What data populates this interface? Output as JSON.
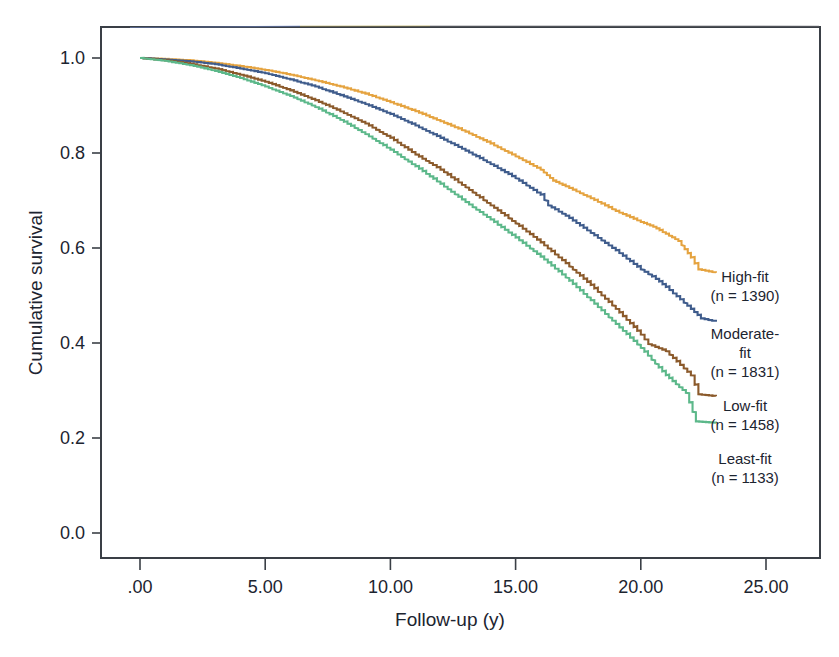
{
  "figure": {
    "background": "#ffffff",
    "frame_color": "#3a3f46"
  },
  "chart_data": {
    "type": "line",
    "subtype": "kaplan-meier-survival",
    "title": "",
    "xlabel": "Follow-up (y)",
    "ylabel": "Cumulative survival",
    "xlim": [
      0,
      26.2
    ],
    "ylim": [
      0,
      1.06
    ],
    "xticks": [
      0,
      5,
      10,
      15,
      20,
      25
    ],
    "xticklabels": [
      ".00",
      "5.00",
      "10.00",
      "15.00",
      "20.00",
      "25.00"
    ],
    "yticks": [
      0.0,
      0.2,
      0.4,
      0.6,
      0.8,
      1.0
    ],
    "yticklabels": [
      "0.0",
      "0.2",
      "0.4",
      "0.6",
      "0.8",
      "1.0"
    ],
    "grid": false,
    "legend_position": "right-inline",
    "series": [
      {
        "name": "High-fit",
        "label_line1": "High-fit",
        "label_line2": "(n = 1390)",
        "n": 1390,
        "color": "#E5A33F",
        "x": [
          0,
          1,
          2,
          3,
          4,
          5,
          6,
          7,
          8,
          9,
          10,
          11,
          12,
          13,
          14,
          15,
          16,
          16.5,
          17,
          18,
          19,
          20,
          20.5,
          21,
          21.5,
          22,
          22.3,
          23
        ],
        "y": [
          1.0,
          0.998,
          0.995,
          0.99,
          0.983,
          0.975,
          0.965,
          0.953,
          0.94,
          0.925,
          0.907,
          0.888,
          0.867,
          0.845,
          0.82,
          0.793,
          0.765,
          0.742,
          0.73,
          0.705,
          0.678,
          0.655,
          0.645,
          0.63,
          0.615,
          0.58,
          0.555,
          0.548
        ]
      },
      {
        "name": "Moderate-fit",
        "label_line1": "Moderate-",
        "label_line2": "fit",
        "label_line3": "(n = 1831)",
        "n": 1831,
        "color": "#3F5C8C",
        "x": [
          0,
          1,
          2,
          3,
          4,
          5,
          6,
          7,
          8,
          9,
          10,
          11,
          12,
          13,
          14,
          15,
          16,
          16.3,
          17,
          18,
          19,
          20,
          20.6,
          21,
          22,
          22.4,
          23
        ],
        "y": [
          1.0,
          0.997,
          0.993,
          0.987,
          0.978,
          0.968,
          0.955,
          0.94,
          0.922,
          0.903,
          0.882,
          0.858,
          0.832,
          0.805,
          0.777,
          0.747,
          0.712,
          0.69,
          0.668,
          0.632,
          0.595,
          0.555,
          0.535,
          0.518,
          0.472,
          0.452,
          0.445
        ]
      },
      {
        "name": "Low-fit",
        "label_line1": "Low-fit",
        "label_line2": "(n = 1458)",
        "n": 1458,
        "color": "#8B5A2B",
        "x": [
          0,
          1,
          2,
          3,
          4,
          5,
          6,
          7,
          8,
          9,
          10,
          11,
          11.7,
          12,
          13,
          14,
          15,
          16,
          17,
          18,
          19,
          20,
          20.3,
          21,
          22,
          22.3,
          23
        ],
        "y": [
          1.0,
          0.995,
          0.988,
          0.978,
          0.965,
          0.95,
          0.932,
          0.911,
          0.888,
          0.862,
          0.832,
          0.797,
          0.775,
          0.765,
          0.728,
          0.69,
          0.652,
          0.612,
          0.568,
          0.522,
          0.472,
          0.418,
          0.398,
          0.383,
          0.332,
          0.292,
          0.288
        ]
      },
      {
        "name": "Least-fit",
        "label_line1": "Least-fit",
        "label_line2": "(n = 1133)",
        "n": 1133,
        "color": "#5CB88A",
        "x": [
          0,
          1,
          2,
          3,
          4,
          5,
          6,
          7,
          8,
          9,
          10,
          11,
          12,
          13,
          14,
          15,
          16,
          17,
          18,
          19,
          20,
          21,
          21.8,
          22.2,
          23
        ],
        "y": [
          1.0,
          0.994,
          0.985,
          0.973,
          0.958,
          0.94,
          0.92,
          0.897,
          0.87,
          0.84,
          0.807,
          0.772,
          0.735,
          0.697,
          0.66,
          0.622,
          0.582,
          0.538,
          0.49,
          0.44,
          0.39,
          0.332,
          0.295,
          0.235,
          0.232
        ]
      }
    ]
  },
  "legend": {
    "entries": [
      {
        "name": "High-fit",
        "lines": [
          "High-fit",
          "(n = 1390)"
        ]
      },
      {
        "name": "Moderate-fit",
        "lines": [
          "Moderate-",
          "fit",
          "(n = 1831)"
        ]
      },
      {
        "name": "Low-fit",
        "lines": [
          "Low-fit",
          "(n = 1458)"
        ]
      },
      {
        "name": "Least-fit",
        "lines": [
          "Least-fit",
          "(n = 1133)"
        ]
      }
    ]
  }
}
